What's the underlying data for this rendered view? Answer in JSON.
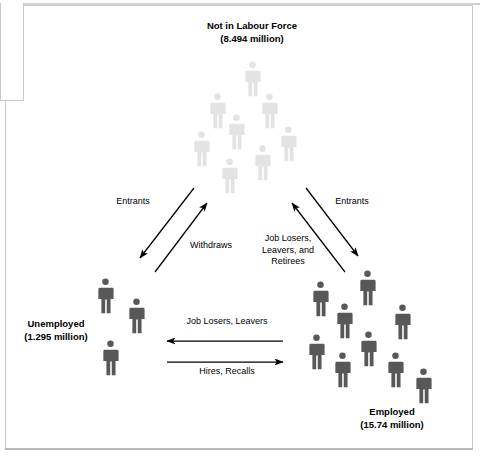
{
  "diagram": {
    "type": "flow",
    "title_visible": false,
    "colors": {
      "inactive_figure": "#e3e3e3",
      "active_figure": "#585858",
      "arrow": "#000000",
      "text": "#000000",
      "frame": "#c9c9c9"
    },
    "groups": [
      {
        "id": "not-in-labour-force",
        "name": "Not in Labour Force",
        "value": "(8.494 million)",
        "figure_count": 10,
        "figure_shade": "light"
      },
      {
        "id": "unemployed",
        "name": "Unemployed",
        "value": "(1.295 million)",
        "figure_count": 3,
        "figure_shade": "dark"
      },
      {
        "id": "employed",
        "name": "Employed",
        "value": "(15.74 million)",
        "figure_count": 9,
        "figure_shade": "dark"
      }
    ],
    "flows": [
      {
        "id": "entrants-left",
        "label": "Entrants",
        "from": "not-in-labour-force",
        "to": "unemployed"
      },
      {
        "id": "withdraws",
        "label": "Withdraws",
        "from": "unemployed",
        "to": "not-in-labour-force"
      },
      {
        "id": "entrants-right",
        "label": "Entrants",
        "from": "not-in-labour-force",
        "to": "employed"
      },
      {
        "id": "job-losers-leavers-retirees",
        "label_line1": "Job Losers,",
        "label_line2": "Leavers, and",
        "label_line3": "Retirees",
        "from": "employed",
        "to": "not-in-labour-force"
      },
      {
        "id": "job-losers-leavers",
        "label": "Job Losers, Leavers",
        "from": "employed",
        "to": "unemployed"
      },
      {
        "id": "hires-recalls",
        "label": "Hires, Recalls",
        "from": "unemployed",
        "to": "employed"
      }
    ]
  }
}
